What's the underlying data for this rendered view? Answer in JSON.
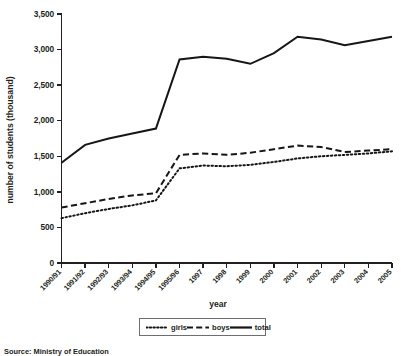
{
  "figure": {
    "source_note": "Source: Ministry of Education"
  },
  "legend": {
    "position": "bottom-center",
    "entries": [
      {
        "label": "girls",
        "style": "dotted",
        "swatch_name": "legend-swatch-girls"
      },
      {
        "label": "boys",
        "style": "dashed",
        "swatch_name": "legend-swatch-boys"
      },
      {
        "label": "total",
        "style": "solid",
        "swatch_name": "legend-swatch-total"
      }
    ]
  },
  "chart_data": {
    "type": "line",
    "title": "",
    "subtitle": "",
    "xlabel": "year",
    "ylabel": "number of students (thousand)",
    "xlim": [
      0,
      14
    ],
    "ylim": [
      0,
      3500
    ],
    "ytick_step": 500,
    "grid": false,
    "legend_position": "bottom-center",
    "annotations": [
      "Source: Ministry of Education"
    ],
    "categories": [
      "1990/91",
      "1991/92",
      "1992/93",
      "1993/94",
      "1994/95",
      "1995/96",
      "1997",
      "1998",
      "1999",
      "2000",
      "2001",
      "2002",
      "2003",
      "2004",
      "2005"
    ],
    "ytick_labels": [
      "0",
      "500",
      "1,000",
      "1,500",
      "2,000",
      "2,500",
      "3,000",
      "3,500"
    ],
    "ytick_values": [
      0,
      500,
      1000,
      1500,
      2000,
      2500,
      3000,
      3500
    ],
    "series": [
      {
        "name": "girls",
        "style": "dotted",
        "values": [
          630,
          700,
          760,
          810,
          880,
          1330,
          1370,
          1360,
          1380,
          1420,
          1470,
          1500,
          1520,
          1540,
          1570
        ]
      },
      {
        "name": "boys",
        "style": "dashed",
        "values": [
          780,
          840,
          900,
          950,
          980,
          1520,
          1540,
          1520,
          1550,
          1600,
          1650,
          1630,
          1560,
          1580,
          1600
        ]
      },
      {
        "name": "total",
        "style": "solid",
        "values": [
          1410,
          1660,
          1750,
          1820,
          1890,
          2860,
          2900,
          2870,
          2800,
          2950,
          3180,
          3140,
          3060,
          3120,
          3180
        ]
      }
    ]
  }
}
